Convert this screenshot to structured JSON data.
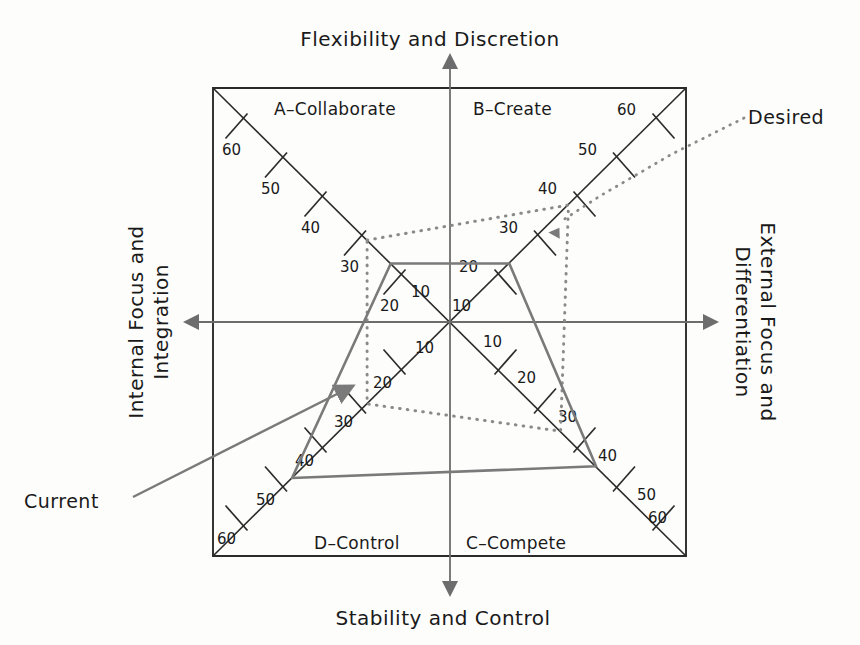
{
  "chart_data": {
    "type": "radar",
    "axis_titles": {
      "top": "Flexibility and Discretion",
      "bottom": "Stability and Control",
      "left": "Internal Focus and\nIntegration",
      "left_line1": "Internal Focus and",
      "left_line2": "Integration",
      "right_line1": "External Focus and",
      "right_line2": "Differentiation"
    },
    "quadrants": [
      {
        "key": "A",
        "label": "A–Collaborate",
        "position": "top-left"
      },
      {
        "key": "B",
        "label": "B–Create",
        "position": "top-right"
      },
      {
        "key": "C",
        "label": "C–Compete",
        "position": "bottom-right"
      },
      {
        "key": "D",
        "label": "D–Control",
        "position": "bottom-left"
      }
    ],
    "scale": {
      "ticks": [
        10,
        20,
        30,
        40,
        50,
        60
      ],
      "tick_labels": [
        "10",
        "20",
        "30",
        "40",
        "50",
        "60"
      ],
      "min": 0,
      "max": 60,
      "direction": "center-is-zero, outward-increasing"
    },
    "series": [
      {
        "name": "Current",
        "style": "solid",
        "color": "#7a7a7a",
        "values": {
          "A": 15,
          "B": 15,
          "C": 37,
          "D": 40
        },
        "categories": [
          "A–Collaborate",
          "B–Create",
          "C–Compete",
          "D–Control"
        ]
      },
      {
        "name": "Desired",
        "style": "dotted",
        "color": "#8a8a8a",
        "values": {
          "A": 21,
          "B": 30,
          "C": 28,
          "D": 21
        },
        "categories": [
          "A–Collaborate",
          "B–Create",
          "C–Compete",
          "D–Control"
        ]
      }
    ],
    "legend": [
      {
        "label": "Current",
        "style": "solid"
      },
      {
        "label": "Desired",
        "style": "dotted"
      }
    ],
    "grid": false,
    "legend_position": "outside-left-and-right"
  },
  "tick_label_sets": {
    "a_collaborate": [
      "60",
      "50",
      "40",
      "30",
      "20",
      "10"
    ],
    "b_create": [
      "60",
      "50",
      "40",
      "30",
      "20",
      "10"
    ],
    "c_compete": [
      "60",
      "50",
      "40",
      "30",
      "20",
      "10"
    ],
    "d_control": [
      "60",
      "50",
      "40",
      "30",
      "20",
      "10"
    ]
  },
  "legend": {
    "current": "Current",
    "desired": "Desired"
  }
}
